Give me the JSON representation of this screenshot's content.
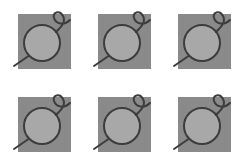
{
  "grid": {
    "columns": 3,
    "rows": 2,
    "tile_size": 53,
    "tiles": [
      {
        "icon": "circle-loop-icon",
        "x": 18,
        "y": 14
      },
      {
        "icon": "circle-loop-icon",
        "x": 98,
        "y": 14
      },
      {
        "icon": "circle-loop-icon",
        "x": 178,
        "y": 14
      },
      {
        "icon": "circle-loop-icon",
        "x": 18,
        "y": 97
      },
      {
        "icon": "circle-loop-icon",
        "x": 98,
        "y": 97
      },
      {
        "icon": "circle-loop-icon",
        "x": 178,
        "y": 97
      }
    ]
  },
  "colors": {
    "background": "#ffffff",
    "square": "#8a8a8a",
    "circle_fill": "#a8a8a8",
    "stroke": "#3c3c3c"
  }
}
